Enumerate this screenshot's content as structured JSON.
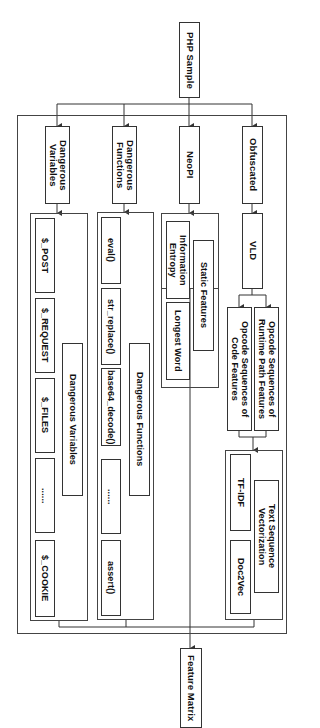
{
  "diagram": {
    "root": {
      "label": "PHP Sample"
    },
    "output": {
      "label": "Feature Matrix"
    },
    "branches": [
      {
        "label": "Dangerous\nVariables",
        "group_label": "Dangerous Variables",
        "items": [
          "$_POST",
          "$_REQUEST",
          "$_FILES",
          "......",
          "$_COOKIE"
        ]
      },
      {
        "label": "Dangerous\nFunctions",
        "group_label": "Dangerous Functions",
        "items": [
          "eval()",
          "str_replace()",
          "base64_decode()",
          "......",
          "assert()"
        ]
      },
      {
        "label": "NeoPI",
        "group_label": "Static Features",
        "items": [
          "Information\nEntropy",
          "Longest Word"
        ]
      },
      {
        "label": "Obfuscated",
        "tool": "VLD",
        "sequences": [
          "Opcode Sequences of\nRuntime Path Features",
          "Opcode Sequences of\nCode Features"
        ],
        "group_label": "Text Sequence\nVectorization",
        "items": [
          "TF-IDF",
          "Doc2Vec"
        ]
      }
    ],
    "colors": {
      "line": "#333333",
      "background": "#ffffff",
      "text": "#111111"
    }
  }
}
